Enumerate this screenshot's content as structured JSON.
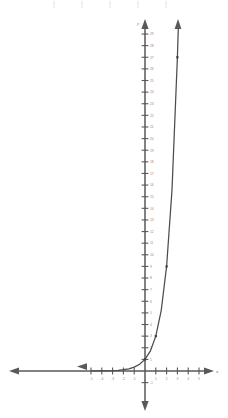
{
  "figure": {
    "axes": {
      "x_axis_label": "x",
      "y_axis_label": "y",
      "x_ticks": [
        -5,
        -4,
        -3,
        -2,
        -1,
        1,
        2,
        3,
        4,
        5
      ],
      "x_tick_labels": [
        "-5",
        "-4",
        "-3",
        "-2",
        "-1",
        "1",
        "2",
        "3",
        "4",
        "5"
      ],
      "y_ticks": [
        1,
        2,
        3,
        4,
        5,
        6,
        7,
        8,
        9,
        10,
        11,
        12,
        13,
        14,
        15,
        16,
        17,
        18,
        19,
        20,
        21,
        22,
        23,
        24,
        25,
        26,
        27,
        28,
        29
      ],
      "y_tick_labels": [
        "1",
        "2",
        "3",
        "4",
        "5",
        "6",
        "7",
        "8",
        "9",
        "10",
        "11",
        "12",
        "13",
        "14",
        "15",
        "16",
        "17",
        "18",
        "19",
        "20",
        "21",
        "22",
        "23",
        "24",
        "25",
        "26",
        "27",
        "28",
        "29"
      ],
      "y_negative_ticks": [
        -1
      ],
      "y_negative_tick_labels": [
        "-1"
      ],
      "xlim": [
        -5.8,
        5.9
      ],
      "ylim": [
        -4,
        30
      ],
      "origin_label": ""
    },
    "colors": {
      "axis": "#595959",
      "curve": "#4d4d4d",
      "tick_label": "#8a8a8a",
      "point": "#3d3d3d",
      "background": "#ffffff",
      "faint_tick": "#e2e2e2"
    },
    "top_strip_ticks": 5
  },
  "chart_data": {
    "type": "line",
    "title": "",
    "xlabel": "x",
    "ylabel": "y",
    "xlim": [
      -5.8,
      5.9
    ],
    "ylim": [
      -4,
      30
    ],
    "grid": false,
    "legend": "none",
    "function": "y = 3^x",
    "series": [
      {
        "name": "y = 3^x",
        "x": [
          -5,
          -4.5,
          -4,
          -3.5,
          -3,
          -2.5,
          -2,
          -1.5,
          -1,
          -0.5,
          0,
          0.5,
          1,
          1.5,
          2,
          2.5,
          3,
          3.1
        ],
        "y": [
          0.004,
          0.007,
          0.012,
          0.021,
          0.037,
          0.064,
          0.111,
          0.192,
          0.333,
          0.577,
          1,
          1.732,
          3,
          5.196,
          9,
          15.588,
          27,
          30
        ]
      }
    ],
    "marked_points": [
      {
        "x": 0,
        "y": 1,
        "label": ""
      },
      {
        "x": 1,
        "y": 3,
        "label": ""
      },
      {
        "x": 2,
        "y": 9,
        "label": ""
      },
      {
        "x": 3,
        "y": 27,
        "label": ""
      }
    ],
    "annotations": [
      {
        "type": "arrow",
        "at": "left-end-of-curve",
        "direction": "left",
        "note": "curve approaches horizontal asymptote y = 0"
      },
      {
        "type": "arrow",
        "at": "right-end-of-curve",
        "direction": "up",
        "note": "curve increases without bound"
      }
    ]
  }
}
